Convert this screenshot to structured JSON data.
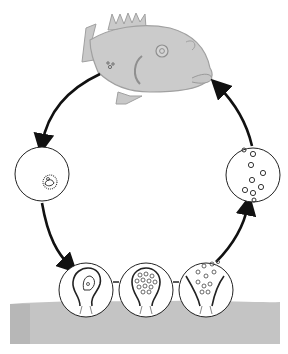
{
  "diagram": {
    "type": "life-cycle",
    "stages": [
      {
        "id": "adult-host",
        "name": "fish-host",
        "position": "top"
      },
      {
        "id": "cyst-released",
        "name": "encysted-trophont",
        "position": "left"
      },
      {
        "id": "tomont-attached",
        "name": "tomont-on-substrate",
        "position": "bottom-left"
      },
      {
        "id": "tomont-dividing",
        "name": "dividing-tomont",
        "position": "bottom-center"
      },
      {
        "id": "tomites-released",
        "name": "tomites-bursting",
        "position": "bottom-right"
      },
      {
        "id": "free-swimming",
        "name": "free-swimming-theronts",
        "position": "right"
      }
    ],
    "flow": "clockwise",
    "colors": {
      "fish": "#c9c9c9",
      "fish_outline": "#9a9a9a",
      "sediment": "#c2c2c2",
      "lines": "#111111"
    }
  }
}
